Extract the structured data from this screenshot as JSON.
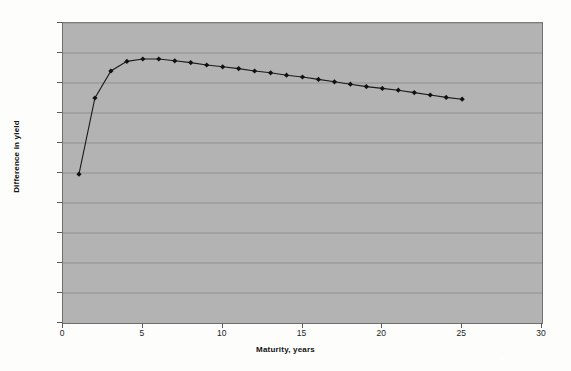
{
  "chart_data": {
    "type": "line",
    "title": "",
    "xlabel": "Maturity, years",
    "ylabel": "Difference in yield",
    "xlim": [
      0,
      30
    ],
    "ylim": [
      0,
      0.05
    ],
    "grid": true,
    "legend": null,
    "marker": "diamond",
    "y_tick_labels": [
      "0.00%",
      "0.50%",
      "1.00%",
      "1.50%",
      "2.00%",
      "2.50%",
      "3.00%",
      "3.50%",
      "4.00%",
      "4.50%",
      "5.00%"
    ],
    "y_tick_values": [
      0.0,
      0.005,
      0.01,
      0.015,
      0.02,
      0.025,
      0.03,
      0.035,
      0.04,
      0.045,
      0.05
    ],
    "x_tick_labels": [
      "0",
      "5",
      "10",
      "15",
      "20",
      "25",
      "30"
    ],
    "x_tick_values": [
      0,
      5,
      10,
      15,
      20,
      25,
      30
    ],
    "x": [
      1,
      2,
      3,
      4,
      5,
      6,
      7,
      8,
      9,
      10,
      11,
      12,
      13,
      14,
      15,
      16,
      17,
      18,
      19,
      20,
      21,
      22,
      23,
      24,
      25
    ],
    "values": [
      0.0248,
      0.0375,
      0.042,
      0.0436,
      0.044,
      0.044,
      0.0437,
      0.0434,
      0.043,
      0.0427,
      0.0424,
      0.042,
      0.0417,
      0.0413,
      0.041,
      0.0406,
      0.0402,
      0.0398,
      0.0394,
      0.0391,
      0.0388,
      0.0384,
      0.038,
      0.0376,
      0.0373
    ],
    "series_name": "Difference in yield"
  },
  "colors": {
    "plot_background": "#b3b3b3",
    "page_background": "#fdfdfc",
    "gridline": "#8f8f8f",
    "plot_border": "#6f6f6f",
    "series_line": "#1a1a1a",
    "marker_fill": "#111111",
    "tick_text": "#1c1c1c",
    "axis_title_text": "#111111"
  }
}
